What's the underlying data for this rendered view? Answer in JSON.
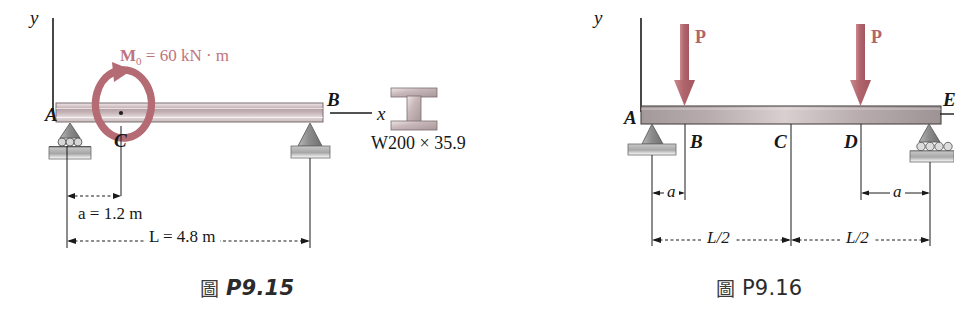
{
  "page": {
    "background": "#ffffff",
    "accent_load_color": "#b2636a",
    "beam_color": "#b9a8ab",
    "support_color": "#8f8f8f"
  },
  "figures": [
    {
      "id": "P9.15",
      "caption": {
        "cjk": "圖",
        "number": "P9.15",
        "style": "italic"
      },
      "axes": {
        "y_label": "y",
        "x_label": "x"
      },
      "points": [
        {
          "label": "A",
          "role": "left-support-roller"
        },
        {
          "label": "C",
          "role": "moment-application-point"
        },
        {
          "label": "B",
          "role": "right-support-pin"
        }
      ],
      "loads": [
        {
          "type": "applied-moment",
          "symbol": "M",
          "subscript": "0",
          "equals": "=",
          "value": "60",
          "unit": "kN · m",
          "full_text": "M0 = 60 kN · m",
          "direction": "counterclockwise",
          "color": "#c0737c"
        }
      ],
      "dimensions": [
        {
          "name": "a",
          "text": "a = 1.2 m",
          "symbol": "a",
          "value": "1.2",
          "unit": "m"
        },
        {
          "name": "L",
          "text": "L = 4.8 m",
          "symbol": "L",
          "value": "4.8",
          "unit": "m"
        }
      ],
      "cross_section": {
        "shape": "wide-flange-I-beam",
        "designation": "W200 × 35.9"
      }
    },
    {
      "id": "P9.16",
      "caption": {
        "cjk": "圖",
        "number": "P9.16",
        "style": "plain"
      },
      "axes": {
        "y_label": "y",
        "x_label": ""
      },
      "points": [
        {
          "label": "A",
          "role": "left-support-pin"
        },
        {
          "label": "B",
          "role": "load-point-left"
        },
        {
          "label": "C",
          "role": "midspan"
        },
        {
          "label": "D",
          "role": "load-point-right"
        },
        {
          "label": "E",
          "role": "right-support-roller"
        }
      ],
      "loads": [
        {
          "type": "point-force",
          "symbol": "P",
          "at": "B",
          "direction": "down",
          "color": "#b2636a"
        },
        {
          "type": "point-force",
          "symbol": "P",
          "at": "D",
          "direction": "down",
          "color": "#b2636a"
        }
      ],
      "dimensions": [
        {
          "name": "a-left",
          "text": "a",
          "symbol": "a"
        },
        {
          "name": "a-right",
          "text": "a",
          "symbol": "a"
        },
        {
          "name": "half-left",
          "text": "L/2"
        },
        {
          "name": "half-right",
          "text": "L/2"
        }
      ]
    }
  ]
}
